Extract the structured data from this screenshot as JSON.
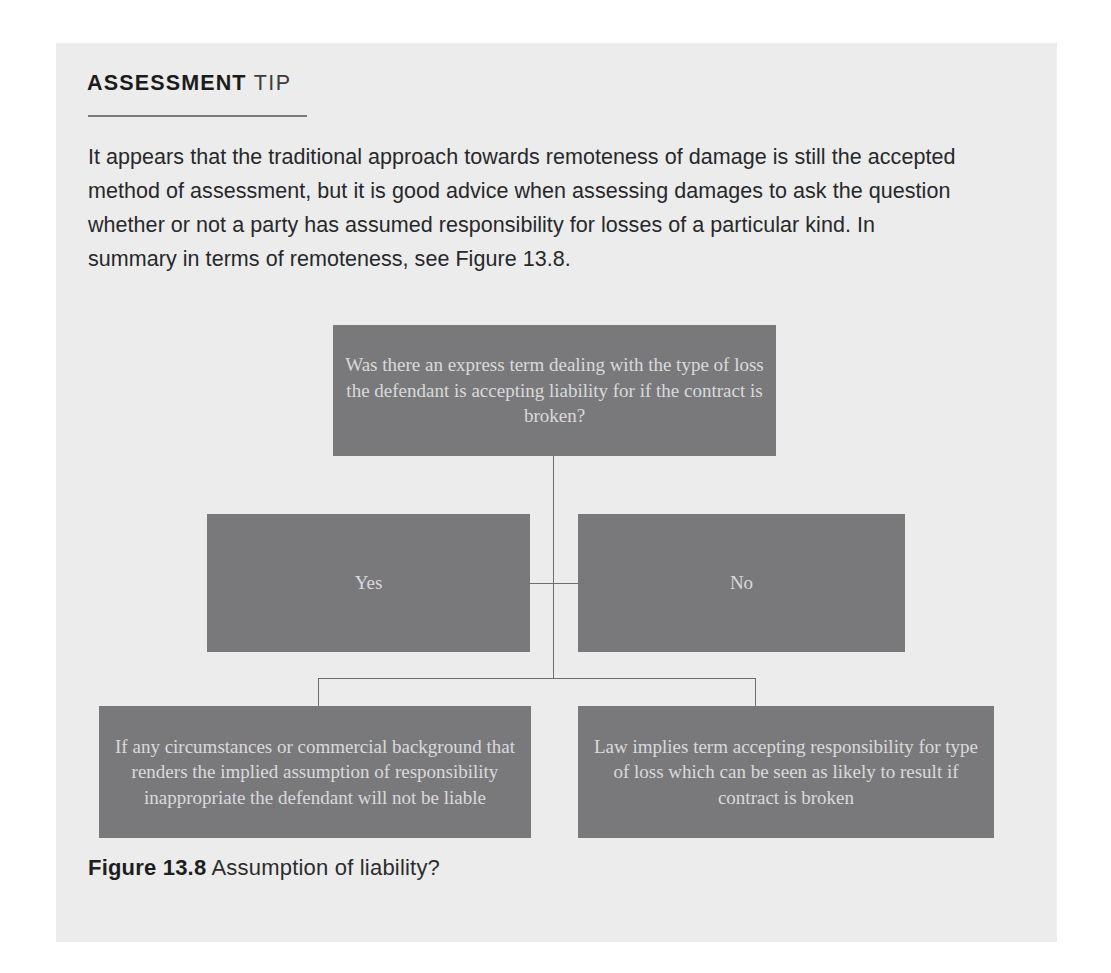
{
  "card": {
    "header": {
      "primary": "ASSESSMENT",
      "secondary": "TIP"
    },
    "body": "It appears that the traditional approach towards remoteness of damage is still the accepted method of assessment, but it is good advice when assessing damages to ask the question whether or not a party has assumed responsibility for losses of a particular kind. In summary in terms of remoteness, see Figure 13.8.",
    "caption": {
      "label": "Figure 13.8",
      "text": "Assumption of liability?"
    }
  },
  "colors": {
    "card_background": "#ececed",
    "node_fill": "#79797b",
    "node_text": "#d9d9dc",
    "connector": "#6e6e70",
    "rule": "#7b7b7b",
    "body_text": "#27282a"
  },
  "chart_data": {
    "type": "diagram",
    "title": "Assumption of liability?",
    "nodes": [
      {
        "id": "question",
        "label": "Was there an express term dealing with the type of loss the defendant is accepting liability for if the contract is broken?",
        "role": "decision"
      },
      {
        "id": "yes",
        "label": "Yes",
        "role": "branch"
      },
      {
        "id": "no",
        "label": "No",
        "role": "branch"
      },
      {
        "id": "outcome-left",
        "label": "If any circumstances  or commercial background that renders the implied assumption of responsibility inappropriate the defendant will not be liable",
        "role": "outcome"
      },
      {
        "id": "outcome-right",
        "label": "Law implies term accepting responsibility for type of loss which can be seen as likely to result if contract is broken",
        "role": "outcome"
      }
    ],
    "edges": [
      {
        "from": "question",
        "to": "yes"
      },
      {
        "from": "question",
        "to": "no"
      },
      {
        "from": "no",
        "to": "outcome-left"
      },
      {
        "from": "no",
        "to": "outcome-right"
      }
    ]
  }
}
